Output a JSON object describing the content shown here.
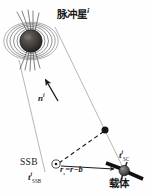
{
  "figure": {
    "kind": "pulsar-navigation-geometry-diagram",
    "background_color": "#fefefe",
    "ink_color": "#1a1a1a",
    "faint_line_color": "#9a9a9a"
  },
  "labels": {
    "pulsar_title": "脉冲星",
    "pulsar_title_index": "i",
    "direction_vector": "n",
    "direction_vector_index": "i",
    "ssb": "SSB",
    "time_ssb_symbol": "t",
    "time_ssb_sup": "i",
    "time_ssb_sub": "SSB",
    "range_equation": "r",
    "range_equation_sub": "s",
    "range_equation_rest": "=r−b",
    "time_sc_symbol": "t",
    "time_sc_sup": "i",
    "time_sc_sub": "SC",
    "spacecraft": "载体"
  },
  "elements": {
    "pulsar_body_name": "pulsar-sphere",
    "field_lines_name": "magnetic-field-lines",
    "beam_name": "radiation-beam",
    "wavefront_left_name": "wavefront-line-left",
    "wavefront_right_name": "wavefront-line-right",
    "n_arrow_name": "direction-arrow",
    "dashed_name": "dashed-projection-line",
    "baseline_arrow_name": "position-vector-arrow",
    "ssb_marker_name": "ssb-origin-marker",
    "node_dot_name": "wavefront-intersection-dot",
    "spacecraft_name": "spacecraft-icon"
  },
  "geometry": {
    "pulsar_center": [
      31,
      41
    ],
    "pulsar_radius": 11,
    "wavefront_left": [
      [
        19,
        62
      ],
      [
        44,
        170
      ]
    ],
    "wavefront_right": [
      [
        55,
        28
      ],
      [
        124,
        172
      ]
    ],
    "n_arrow_tail": [
      57,
      100
    ],
    "n_arrow_head": [
      44,
      78
    ],
    "ssb_point": [
      56,
      164
    ],
    "node_point": [
      105,
      130
    ],
    "spacecraft_point": [
      124,
      171
    ]
  }
}
